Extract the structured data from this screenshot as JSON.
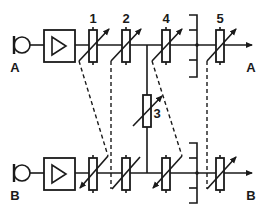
{
  "diagram": {
    "channels": [
      {
        "id": "A",
        "input_label": "A",
        "output_label": "A"
      },
      {
        "id": "B",
        "input_label": "B",
        "output_label": "B"
      }
    ],
    "components": {
      "microphone": "microphone",
      "amplifier": "amplifier",
      "potentiometers": [
        "1",
        "2",
        "3",
        "4",
        "5"
      ]
    },
    "labels": {
      "pot1": "1",
      "pot2": "2",
      "pot3": "3",
      "pot4": "4",
      "pot5": "5",
      "in_a": "A",
      "in_b": "B",
      "out_a": "A",
      "out_b": "B"
    },
    "colors": {
      "line": "#1a1a1a",
      "background": "#ffffff"
    }
  }
}
